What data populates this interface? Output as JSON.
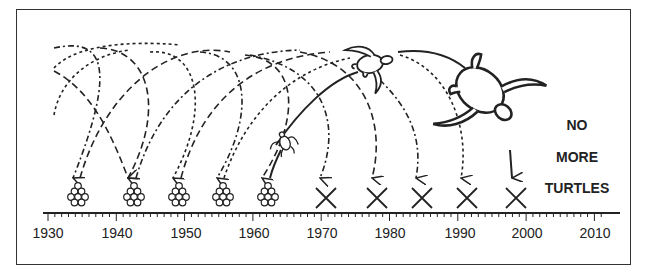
{
  "diagram": {
    "type": "timeline-illustration",
    "axis": {
      "min_year": 1930,
      "max_year": 2010,
      "tick_labels": [
        "1930",
        "1940",
        "1950",
        "1960",
        "1970",
        "1980",
        "1990",
        "2000",
        "2010"
      ],
      "minor_ticks_per_decade": 10
    },
    "nests_with_eggs": [
      {
        "label": "egg-cluster",
        "year": 1934
      },
      {
        "label": "egg-cluster",
        "year": 1942
      },
      {
        "label": "egg-cluster",
        "year": 1949
      },
      {
        "label": "egg-cluster",
        "year": 1955
      },
      {
        "label": "egg-cluster",
        "year": 1962
      }
    ],
    "failed_nests": [
      {
        "label": "X",
        "year": 1970
      },
      {
        "label": "X",
        "year": 1978
      },
      {
        "label": "X",
        "year": 1984
      },
      {
        "label": "X",
        "year": 1991
      },
      {
        "label": "X",
        "year": 1998
      }
    ],
    "turtles": [
      {
        "name": "small-turtle-hatchling",
        "position": "near 1965"
      },
      {
        "name": "medium-turtle",
        "position": "top, near 1975"
      },
      {
        "name": "large-adult-turtle",
        "position": "near 1995"
      }
    ],
    "caption": {
      "line1": "NO",
      "line2": "MORE",
      "line3": "TURTLES"
    },
    "colors": {
      "ink": "#222222",
      "background": "#ffffff",
      "border": "#333333"
    }
  }
}
